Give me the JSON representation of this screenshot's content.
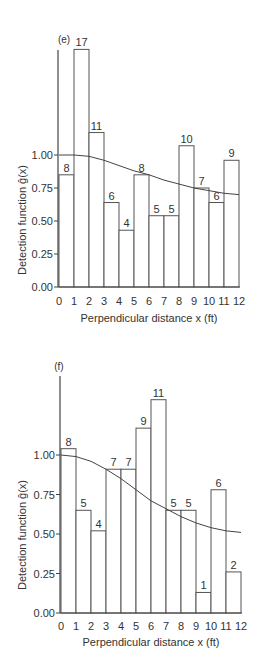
{
  "chart_data": [
    {
      "type": "bar",
      "panel_label": "(e)",
      "title": "",
      "xlabel": "Perpendicular distance x (ft)",
      "ylabel": "Detection function ĝ(x)",
      "x_ticks": [
        "0",
        "1",
        "2",
        "3",
        "4",
        "5",
        "6",
        "7",
        "8",
        "9",
        "10",
        "11",
        "12"
      ],
      "y_ticks": [
        "0.00",
        "0.25",
        "0.50",
        "0.75",
        "1.00"
      ],
      "ylim": [
        0,
        1.8
      ],
      "xlim": [
        0,
        12
      ],
      "grid": false,
      "bins": [
        [
          0,
          1
        ],
        [
          1,
          2
        ],
        [
          2,
          3
        ],
        [
          3,
          4
        ],
        [
          4,
          5
        ],
        [
          5,
          6
        ],
        [
          6,
          7
        ],
        [
          7,
          8
        ],
        [
          8,
          9
        ],
        [
          9,
          10
        ],
        [
          10,
          11
        ],
        [
          11,
          12
        ]
      ],
      "counts": [
        8,
        17,
        11,
        6,
        4,
        8,
        5,
        5,
        10,
        7,
        6,
        9
      ],
      "values": [
        0.85,
        1.8,
        1.17,
        0.64,
        0.43,
        0.85,
        0.54,
        0.54,
        1.07,
        0.75,
        0.64,
        0.96
      ],
      "curve": {
        "name": "fitted detection function",
        "x": [
          0,
          1,
          2,
          3,
          4,
          5,
          6,
          7,
          8,
          9,
          10,
          11,
          12
        ],
        "y": [
          1.0,
          1.0,
          0.99,
          0.96,
          0.92,
          0.88,
          0.85,
          0.81,
          0.78,
          0.75,
          0.73,
          0.71,
          0.7
        ]
      }
    },
    {
      "type": "bar",
      "panel_label": "(f)",
      "title": "",
      "xlabel": "Perpendicular distance x (ft)",
      "ylabel": "Detection function ĝ(x)",
      "x_ticks": [
        "0",
        "1",
        "2",
        "3",
        "4",
        "5",
        "6",
        "7",
        "8",
        "9",
        "10",
        "11",
        "12"
      ],
      "y_ticks": [
        "0.00",
        "0.25",
        "0.50",
        "0.75",
        "1.00"
      ],
      "ylim": [
        0,
        1.45
      ],
      "xlim": [
        0,
        12
      ],
      "grid": false,
      "bins": [
        [
          0,
          1
        ],
        [
          1,
          2
        ],
        [
          2,
          3
        ],
        [
          3,
          4
        ],
        [
          4,
          5
        ],
        [
          5,
          6
        ],
        [
          6,
          7
        ],
        [
          7,
          8
        ],
        [
          8,
          9
        ],
        [
          9,
          10
        ],
        [
          10,
          11
        ],
        [
          11,
          12
        ]
      ],
      "counts": [
        8,
        5,
        4,
        7,
        7,
        9,
        11,
        5,
        5,
        1,
        6,
        2
      ],
      "values": [
        1.04,
        0.65,
        0.52,
        0.91,
        0.91,
        1.17,
        1.35,
        0.65,
        0.65,
        0.13,
        0.78,
        0.26
      ],
      "curve": {
        "name": "fitted detection function",
        "x": [
          0,
          1,
          2,
          3,
          4,
          5,
          6,
          7,
          8,
          9,
          10,
          11,
          12
        ],
        "y": [
          1.0,
          0.99,
          0.96,
          0.91,
          0.85,
          0.78,
          0.71,
          0.66,
          0.61,
          0.57,
          0.54,
          0.52,
          0.51
        ]
      }
    }
  ]
}
